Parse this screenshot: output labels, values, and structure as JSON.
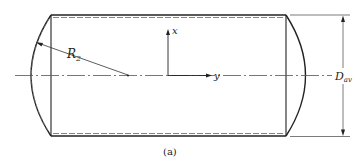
{
  "figure": {
    "caption": "(a)",
    "labels": {
      "radius": "R",
      "radius_sub": "2",
      "axis_x": "x",
      "axis_y": "y",
      "diameter": "D",
      "diameter_sub": "av"
    },
    "colors": {
      "line": "#222222",
      "dashed": "#777777",
      "background": "#ffffff"
    }
  }
}
